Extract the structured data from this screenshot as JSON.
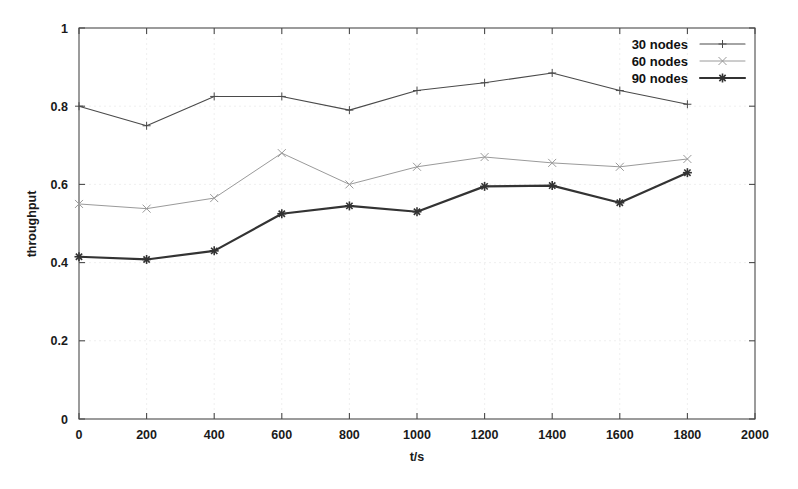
{
  "chart_data": {
    "type": "line",
    "title": "",
    "subtitle": "",
    "xlabel": "t/s",
    "ylabel": "throughput",
    "x": [
      0,
      200,
      400,
      600,
      800,
      1000,
      1200,
      1400,
      1600,
      1800
    ],
    "xlim": [
      0,
      2000
    ],
    "ylim": [
      0,
      1
    ],
    "xticks": [
      0,
      200,
      400,
      600,
      800,
      1000,
      1200,
      1400,
      1600,
      1800,
      2000
    ],
    "xtick_labels": [
      "0",
      "200",
      "400",
      "600",
      "800",
      "1000",
      "1200",
      "1400",
      "1600",
      "1800",
      "2000"
    ],
    "yticks": [
      0,
      0.2,
      0.4,
      0.6,
      0.8,
      1
    ],
    "ytick_labels": [
      "0",
      "0.2",
      "0.4",
      "0.6",
      "0.8",
      "1"
    ],
    "grid": true,
    "legend_position": "top-right",
    "series": [
      {
        "name": "30 nodes",
        "marker": "plus",
        "color": "#4a4a4a",
        "width": 1.1,
        "values": [
          0.8,
          0.75,
          0.825,
          0.825,
          0.79,
          0.84,
          0.86,
          0.885,
          0.84,
          0.805
        ]
      },
      {
        "name": "60 nodes",
        "marker": "cross",
        "color": "#9a9a9a",
        "width": 1.0,
        "values": [
          0.55,
          0.538,
          0.565,
          0.68,
          0.6,
          0.645,
          0.67,
          0.655,
          0.645,
          0.665
        ]
      },
      {
        "name": "90 nodes",
        "marker": "star",
        "color": "#333333",
        "width": 2.2,
        "values": [
          0.415,
          0.408,
          0.43,
          0.525,
          0.545,
          0.53,
          0.595,
          0.597,
          0.553,
          0.63
        ]
      }
    ]
  },
  "legend": {
    "items": [
      {
        "label": "30 nodes"
      },
      {
        "label": "60 nodes"
      },
      {
        "label": "90 nodes"
      }
    ]
  },
  "axes": {
    "x_title": "t/s",
    "y_title": "throughput"
  }
}
